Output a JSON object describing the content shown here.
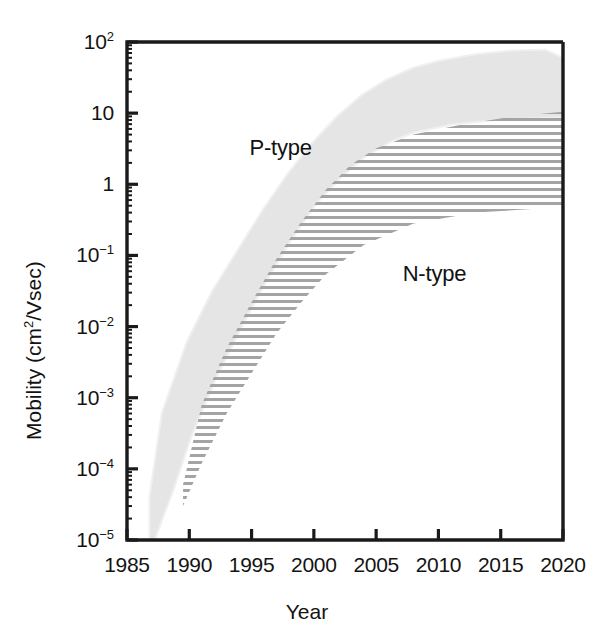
{
  "figure": {
    "background": "#ffffff",
    "frame_color": "#1a1a1a"
  },
  "chart_data": {
    "type": "area",
    "title": "",
    "subtitle": "",
    "xlabel": "Year",
    "ylabel": "Mobility (cm2/Vsec)",
    "ylabel_parts": {
      "pre": "Mobility (cm",
      "sup": "2",
      "post": "/Vsec)"
    },
    "xlim": [
      1985,
      2020
    ],
    "ylim": [
      1e-05,
      100
    ],
    "yscale": "log",
    "xscale": "linear",
    "grid": false,
    "legend_position": "inline-annotations",
    "xticks": [
      1985,
      1990,
      1995,
      2000,
      2005,
      2010,
      2015,
      2020
    ],
    "xtick_labels": [
      "1985",
      "1990",
      "1995",
      "2000",
      "2005",
      "2010",
      "2015",
      "2020"
    ],
    "yticks": [
      100,
      10,
      1,
      0.1,
      0.01,
      0.001,
      0.0001,
      1e-05
    ],
    "ytick_labels": [
      {
        "mantissa": "10",
        "exponent": "2"
      },
      {
        "mantissa": "10",
        "exponent": ""
      },
      {
        "mantissa": "1",
        "exponent": ""
      },
      {
        "mantissa": "10",
        "exponent": "-1"
      },
      {
        "mantissa": "10",
        "exponent": "-2"
      },
      {
        "mantissa": "10",
        "exponent": "-3"
      },
      {
        "mantissa": "10",
        "exponent": "-4"
      },
      {
        "mantissa": "10",
        "exponent": "-5"
      }
    ],
    "annotations": [
      {
        "text": "P-type",
        "x": 1998.2,
        "y": 3.2
      },
      {
        "text": "N-type",
        "x": 2010.5,
        "y": 0.055
      }
    ],
    "series": [
      {
        "name": "P-type",
        "style": "solid-shaded-band",
        "fill_color": "#e4e4e4",
        "upper_bound": [
          {
            "x": 1987.0,
            "y": 4e-05
          },
          {
            "x": 1988.0,
            "y": 0.0006
          },
          {
            "x": 1990.0,
            "y": 0.006
          },
          {
            "x": 1992.0,
            "y": 0.03
          },
          {
            "x": 1994.0,
            "y": 0.11
          },
          {
            "x": 1996.0,
            "y": 0.4
          },
          {
            "x": 1998.0,
            "y": 1.3
          },
          {
            "x": 2000.0,
            "y": 3.6
          },
          {
            "x": 2002.0,
            "y": 8.5
          },
          {
            "x": 2004.0,
            "y": 17.0
          },
          {
            "x": 2006.0,
            "y": 28.0
          },
          {
            "x": 2008.0,
            "y": 40.0
          },
          {
            "x": 2010.0,
            "y": 50.0
          },
          {
            "x": 2013.0,
            "y": 62.0
          },
          {
            "x": 2016.0,
            "y": 70.0
          },
          {
            "x": 2018.5,
            "y": 72.0
          },
          {
            "x": 2020.0,
            "y": 55.0
          }
        ],
        "lower_bound": [
          {
            "x": 1987.0,
            "y": 1e-05
          },
          {
            "x": 1988.5,
            "y": 5e-05
          },
          {
            "x": 1990.0,
            "y": 0.0003
          },
          {
            "x": 1992.0,
            "y": 0.002
          },
          {
            "x": 1994.0,
            "y": 0.01
          },
          {
            "x": 1996.0,
            "y": 0.045
          },
          {
            "x": 1998.0,
            "y": 0.17
          },
          {
            "x": 2000.0,
            "y": 0.55
          },
          {
            "x": 2002.0,
            "y": 1.3
          },
          {
            "x": 2004.0,
            "y": 2.6
          },
          {
            "x": 2006.0,
            "y": 4.2
          },
          {
            "x": 2008.0,
            "y": 5.8
          },
          {
            "x": 2011.0,
            "y": 7.5
          },
          {
            "x": 2015.0,
            "y": 8.8
          },
          {
            "x": 2020.0,
            "y": 9.5
          }
        ]
      },
      {
        "name": "N-type",
        "style": "horizontal-hatch-band",
        "hatch_color": "#a0a0a0",
        "hatch_spacing_px": 7,
        "upper_bound": [
          {
            "x": 1989.5,
            "y": 6e-05
          },
          {
            "x": 1991.0,
            "y": 0.0008
          },
          {
            "x": 1993.0,
            "y": 0.005
          },
          {
            "x": 1995.0,
            "y": 0.022
          },
          {
            "x": 1997.0,
            "y": 0.09
          },
          {
            "x": 1999.0,
            "y": 0.3
          },
          {
            "x": 2001.0,
            "y": 0.85
          },
          {
            "x": 2003.0,
            "y": 1.9
          },
          {
            "x": 2005.0,
            "y": 3.2
          },
          {
            "x": 2008.0,
            "y": 5.0
          },
          {
            "x": 2012.0,
            "y": 7.0
          },
          {
            "x": 2016.0,
            "y": 9.0
          },
          {
            "x": 2020.0,
            "y": 10.5
          }
        ],
        "lower_bound": [
          {
            "x": 1989.5,
            "y": 3e-05
          },
          {
            "x": 1991.0,
            "y": 0.00012
          },
          {
            "x": 1993.0,
            "y": 0.0006
          },
          {
            "x": 1995.0,
            "y": 0.0022
          },
          {
            "x": 1997.0,
            "y": 0.008
          },
          {
            "x": 1999.0,
            "y": 0.022
          },
          {
            "x": 2001.0,
            "y": 0.055
          },
          {
            "x": 2004.0,
            "y": 0.14
          },
          {
            "x": 2008.0,
            "y": 0.28
          },
          {
            "x": 2013.0,
            "y": 0.4
          },
          {
            "x": 2020.0,
            "y": 0.48
          }
        ]
      }
    ]
  }
}
